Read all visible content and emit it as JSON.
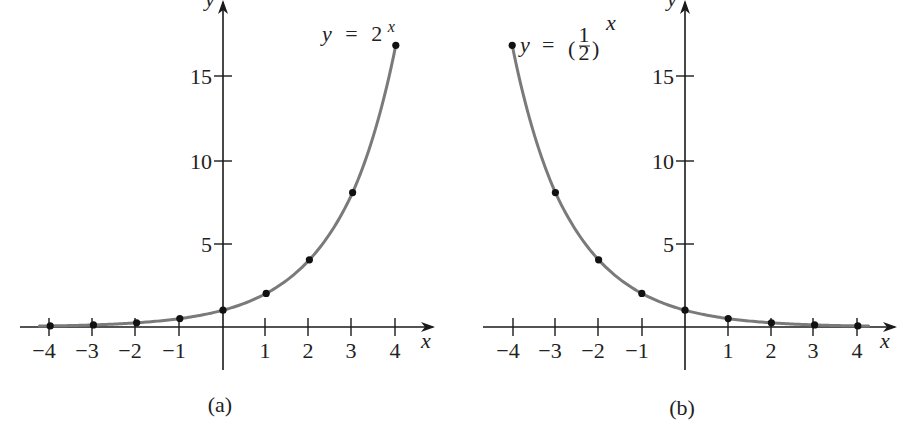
{
  "chart_data": [
    {
      "type": "line",
      "panel_caption": "(a)",
      "title": "y = 2^x",
      "label_text": {
        "y": "y",
        "equals": "=",
        "base": "2",
        "exponent": "x"
      },
      "xlabel": "x",
      "ylabel": "y",
      "x": [
        -4,
        -3,
        -2,
        -1,
        0,
        1,
        2,
        3,
        4
      ],
      "values": [
        0.0625,
        0.125,
        0.25,
        0.5,
        1,
        2,
        4,
        8,
        16
      ],
      "xticks": [
        "−4",
        "−3",
        "−2",
        "−1",
        "1",
        "2",
        "3",
        "4"
      ],
      "yticks": [
        "5",
        "10",
        "15"
      ],
      "xlim": [
        -4.7,
        4.9
      ],
      "ylim": [
        -2.5,
        19.5
      ],
      "grid": false,
      "legend": "none",
      "markers": "filled circles at integer x"
    },
    {
      "type": "line",
      "panel_caption": "(b)",
      "title": "y = (1/2)^x",
      "label_text": {
        "y": "y",
        "equals": "=",
        "num": "1",
        "den": "2",
        "exponent": "x"
      },
      "xlabel": "x",
      "ylabel": "y",
      "x": [
        -4,
        -3,
        -2,
        -1,
        0,
        1,
        2,
        3,
        4
      ],
      "values": [
        16,
        8,
        4,
        2,
        1,
        0.5,
        0.25,
        0.125,
        0.0625
      ],
      "xticks": [
        "−4",
        "−3",
        "−2",
        "−1",
        "1",
        "2",
        "3",
        "4"
      ],
      "yticks": [
        "5",
        "10",
        "15"
      ],
      "xlim": [
        -4.7,
        4.9
      ],
      "ylim": [
        -2.5,
        19.5
      ],
      "grid": false,
      "legend": "none",
      "markers": "filled circles at integer x"
    }
  ],
  "panels": {
    "a": {
      "caption": "(a)",
      "x_axis_label": "x",
      "y_axis_label": "y",
      "xticks": [
        "−4",
        "−3",
        "−2",
        "−1",
        "1",
        "2",
        "3",
        "4"
      ],
      "yticks": [
        "15",
        "10",
        "5"
      ],
      "eq_y": "y",
      "eq_eq": "=",
      "eq_base": "2",
      "eq_exp": "x"
    },
    "b": {
      "caption": "(b)",
      "x_axis_label": "x",
      "y_axis_label": "y",
      "xticks": [
        "−4",
        "−3",
        "−2",
        "−1",
        "1",
        "2",
        "3",
        "4"
      ],
      "yticks": [
        "15",
        "10",
        "5"
      ],
      "eq_y": "y",
      "eq_eq": "=",
      "eq_num": "1",
      "eq_den": "2",
      "eq_exp": "x"
    }
  },
  "colors": {
    "curve": "#7a7a7a",
    "axis": "#1a1a1a",
    "dot": "#111111"
  }
}
